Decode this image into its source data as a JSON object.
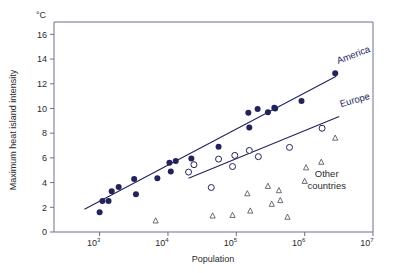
{
  "chart_data": {
    "type": "scatter",
    "title": "",
    "xlabel": "Population",
    "ylabel": "Maximum heat island intensity",
    "unit_label": "°C",
    "xscale": "log",
    "xlim": [
      215,
      10000000
    ],
    "ylim": [
      0,
      17.0
    ],
    "grid": false,
    "legend_position": "inline-annotations",
    "xticks": [
      {
        "value": 1000,
        "label": "10",
        "exp": "3"
      },
      {
        "value": 10000,
        "label": "10",
        "exp": "4"
      },
      {
        "value": 100000,
        "label": "10",
        "exp": "5"
      },
      {
        "value": 1000000,
        "label": "10",
        "exp": "6"
      },
      {
        "value": 10000000,
        "label": "10",
        "exp": "7"
      }
    ],
    "yticks": [
      0,
      2,
      4,
      6,
      8,
      10,
      12,
      14,
      16
    ],
    "series": [
      {
        "name": "America",
        "marker": "filled-circle",
        "color": "#23235c",
        "points": [
          [
            1000,
            1.6
          ],
          [
            1100,
            2.5
          ],
          [
            1350,
            2.5
          ],
          [
            1500,
            3.3
          ],
          [
            1900,
            3.65
          ],
          [
            3200,
            4.3
          ],
          [
            3400,
            3.05
          ],
          [
            7000,
            4.35
          ],
          [
            10500,
            5.6
          ],
          [
            11000,
            4.9
          ],
          [
            13000,
            5.75
          ],
          [
            22000,
            5.95
          ],
          [
            55000,
            6.9
          ],
          [
            150000,
            9.65
          ],
          [
            155000,
            8.45
          ],
          [
            205000,
            9.95
          ],
          [
            290000,
            9.7
          ],
          [
            360000,
            10.05
          ],
          [
            370000,
            10.0
          ],
          [
            900000,
            10.6
          ],
          [
            2800000,
            12.85
          ]
        ],
        "fit_line": {
          "x1": 600,
          "y1": 1.85,
          "x2": 2900000,
          "y2": 12.6
        }
      },
      {
        "name": "Europe",
        "marker": "open-circle",
        "color": "#23235c",
        "points": [
          [
            20000,
            4.85
          ],
          [
            24000,
            5.45
          ],
          [
            43000,
            3.6
          ],
          [
            55000,
            5.9
          ],
          [
            88000,
            5.3
          ],
          [
            95000,
            6.2
          ],
          [
            155000,
            6.6
          ],
          [
            210000,
            6.1
          ],
          [
            600000,
            6.85
          ],
          [
            1800000,
            8.4
          ]
        ],
        "fit_line": {
          "x1": 20000,
          "y1": 4.35,
          "x2": 3200000,
          "y2": 9.35
        }
      },
      {
        "name": "Other countries",
        "marker": "open-triangle",
        "color": "#5b5b6e",
        "points": [
          [
            6600,
            0.9
          ],
          [
            45000,
            1.3
          ],
          [
            88000,
            1.35
          ],
          [
            145000,
            3.1
          ],
          [
            160000,
            1.7
          ],
          [
            290000,
            3.7
          ],
          [
            330000,
            2.25
          ],
          [
            420000,
            3.35
          ],
          [
            440000,
            2.55
          ],
          [
            560000,
            1.2
          ],
          [
            1000000,
            4.1
          ],
          [
            1050000,
            5.2
          ],
          [
            1750000,
            5.65
          ],
          [
            2800000,
            7.6
          ]
        ]
      }
    ],
    "annotations": [
      {
        "text": "America",
        "x": 3100000,
        "y": 13.6,
        "rotation": -21
      },
      {
        "text": "Europe",
        "x": 3400000,
        "y": 10.1,
        "rotation": -16
      },
      {
        "text": "Other",
        "x": 2100000,
        "y": 4.45,
        "rotation": 0
      },
      {
        "text": "countries",
        "x": 2100000,
        "y": 3.45,
        "rotation": 0
      }
    ]
  },
  "colors": {
    "america": "#23235c",
    "europe": "#23235c",
    "other": "#5b5b6e",
    "frame": "#6f6f8c",
    "text": "#2b2b2b",
    "background": "#ffffff"
  }
}
